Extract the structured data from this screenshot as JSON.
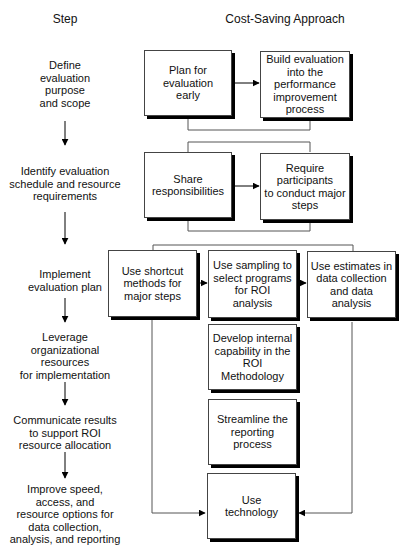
{
  "headers": {
    "step": "Step",
    "approach": "Cost-Saving Approach"
  },
  "steps": [
    {
      "label": "Define\nevaluation\npurpose\nand scope"
    },
    {
      "label": "Identify evaluation\nschedule and resource\nrequirements"
    },
    {
      "label": "Implement\nevaluation plan"
    },
    {
      "label": "Leverage\norganizational\nresources\nfor implementation"
    },
    {
      "label": "Communicate results\nto support ROI\nresource allocation"
    },
    {
      "label": "Improve speed,\naccess, and\nresource options for\ndata collection,\nanalysis, and reporting"
    }
  ],
  "approaches": {
    "plan_early": "Plan for\nevaluation\nearly",
    "build_into_process": "Build evaluation\ninto the\nperformance\nimprovement\nprocess",
    "share_responsibilities": "Share\nresponsibilities",
    "require_participants": "Require\nparticipants\nto conduct major\nsteps",
    "shortcut_methods": "Use shortcut\nmethods for\nmajor steps",
    "sampling": "Use sampling to\nselect programs\nfor ROI\nanalysis",
    "estimates": "Use estimates in\ndata collection\nand data analysis",
    "internal_capability": "Develop internal\ncapability in the\nROI Methodology",
    "streamline_reporting": "Streamline the\nreporting\nprocess",
    "use_technology": "Use\ntechnology"
  },
  "colors": {
    "line": "#555555",
    "arrow": "#000000",
    "shadow": "#000000"
  }
}
